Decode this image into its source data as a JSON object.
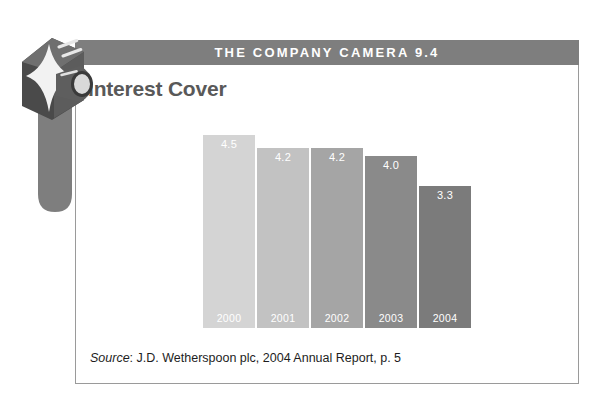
{
  "header": {
    "band_title": "THE COMPANY CAMERA 9.4",
    "band_color": "#7e7e7e"
  },
  "slide": {
    "title": "Interest Cover"
  },
  "logo": {
    "name": "company-camera-logo",
    "description": "3D camera cube with starburst and lens barrel"
  },
  "source": {
    "label": "Source",
    "text": ": J.D. Wetherspoon plc, 2004 Annual Report, p. 5"
  },
  "chart_data": {
    "type": "bar",
    "title": "Interest Cover",
    "categories": [
      "2000",
      "2001",
      "2002",
      "2003",
      "2004"
    ],
    "values": [
      4.5,
      4.2,
      4.2,
      4.0,
      3.3
    ],
    "value_labels": [
      "4.5",
      "4.2",
      "4.2",
      "4.0",
      "3.3"
    ],
    "colors": [
      "#d4d4d4",
      "#c2c2c2",
      "#a5a5a5",
      "#8a8a8a",
      "#7b7b7b"
    ],
    "xlabel": "",
    "ylabel": "",
    "ylim": [
      0,
      4.85
    ],
    "grid": false,
    "legend": false,
    "axis_visible": false,
    "data_labels_inside_top": true,
    "category_labels_inside_bottom": true
  }
}
